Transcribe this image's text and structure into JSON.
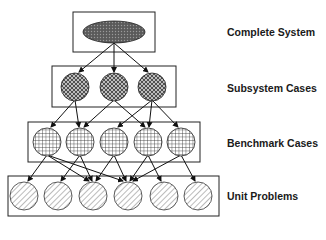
{
  "diagram": {
    "levels": [
      {
        "id": "complete",
        "label": "Complete System",
        "shape": "ellipse",
        "pattern": "dots-dark",
        "count": 1
      },
      {
        "id": "subsystem",
        "label": "Subsystem Cases",
        "shape": "circle",
        "pattern": "crosshatch-diagonal",
        "count": 3
      },
      {
        "id": "benchmark",
        "label": "Benchmark Cases",
        "shape": "circle",
        "pattern": "grid",
        "count": 5
      },
      {
        "id": "unit",
        "label": "Unit Problems",
        "shape": "circle",
        "pattern": "diagonal-lines",
        "count": 6
      }
    ],
    "edges": [
      [
        "C1",
        "S1"
      ],
      [
        "C1",
        "S2"
      ],
      [
        "C1",
        "S3"
      ],
      [
        "S1",
        "B1"
      ],
      [
        "S1",
        "B2"
      ],
      [
        "S2",
        "B2"
      ],
      [
        "S2",
        "B4"
      ],
      [
        "S3",
        "B3"
      ],
      [
        "S3",
        "B4"
      ],
      [
        "S3",
        "B5"
      ],
      [
        "B1",
        "U1"
      ],
      [
        "B1",
        "U3"
      ],
      [
        "B1",
        "U4"
      ],
      [
        "B2",
        "U2"
      ],
      [
        "B2",
        "U3"
      ],
      [
        "B3",
        "U3"
      ],
      [
        "B3",
        "U4"
      ],
      [
        "B4",
        "U4"
      ],
      [
        "B4",
        "U5"
      ],
      [
        "B5",
        "U4"
      ],
      [
        "B5",
        "U6"
      ]
    ],
    "colors": {
      "stroke": "#222222",
      "fill_dark": "#6e6e6e",
      "background": "#ffffff"
    }
  }
}
